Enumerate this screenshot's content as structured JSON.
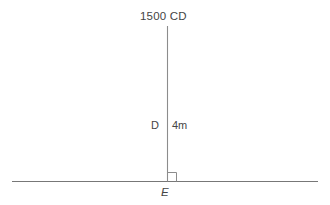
{
  "diagram": {
    "title_label": "1500 CD",
    "vertex_upper_label": "D",
    "measure_label": "4m",
    "vertex_lower_label": "E",
    "right_angle_label": "",
    "colors": {
      "background": "#ffffff",
      "line": "#8c8c8c",
      "ground_line": "#777777",
      "text": "#454545"
    },
    "geometry": {
      "vertical_line_x": 167,
      "vertical_line_top_y": 26,
      "vertical_line_bottom_y": 181,
      "ground_line_y": 181,
      "ground_line_x_start": 12,
      "ground_line_x_end": 318,
      "right_angle_marker_size": 9
    }
  }
}
